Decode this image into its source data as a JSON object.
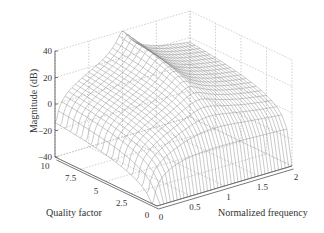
{
  "chart_data": {
    "type": "surface3d",
    "title": "",
    "xlabel": "Normalized frequency",
    "ylabel": "Quality factor",
    "zlabel": "Magnitude (dB)",
    "x_ticks": [
      "0",
      "0.5",
      "1",
      "1.5",
      "2"
    ],
    "y_ticks": [
      "0",
      "2.5",
      "5",
      "7.5",
      "10"
    ],
    "z_ticks": [
      "40",
      "20",
      "0",
      "-20",
      "-40"
    ],
    "xlim": [
      0,
      2
    ],
    "ylim": [
      0,
      10
    ],
    "zlim": [
      -40,
      40
    ],
    "grid": "dotted",
    "sample_points": [
      {
        "f": 1.0,
        "Q": 10,
        "dB": 40
      },
      {
        "f": 1.0,
        "Q": 5,
        "dB": 14
      },
      {
        "f": 1.0,
        "Q": 2.5,
        "dB": 8
      },
      {
        "f": 0.0,
        "Q": 10,
        "dB": 0
      },
      {
        "f": 2.0,
        "Q": 10,
        "dB": -10
      },
      {
        "f": 0.0,
        "Q": 0,
        "dB": -40
      },
      {
        "f": 2.0,
        "Q": 0,
        "dB": -10
      }
    ]
  },
  "axes": {
    "z_label": "Magnitude (dB)",
    "q_label": "Quality factor",
    "f_label": "Normalized frequency"
  }
}
